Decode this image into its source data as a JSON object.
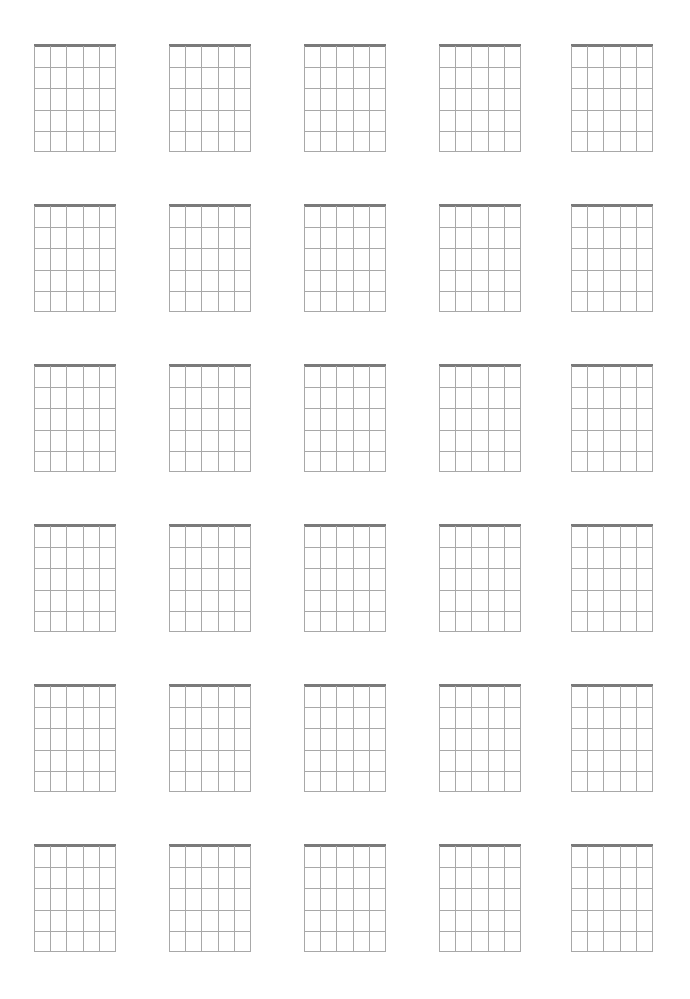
{
  "page": {
    "background": "#ffffff",
    "line_color": "#a8a8a8",
    "nut_color": "#7a7a7a"
  },
  "layout": {
    "columns": 5,
    "rows": 6,
    "diagram_width": 82,
    "diagram_height": 108,
    "col_x": [
      34,
      169,
      304,
      439,
      571
    ],
    "row_y": [
      44,
      204,
      364,
      524,
      684,
      844
    ]
  },
  "diagram": {
    "strings": 6,
    "frets": 5,
    "has_nut": true
  }
}
